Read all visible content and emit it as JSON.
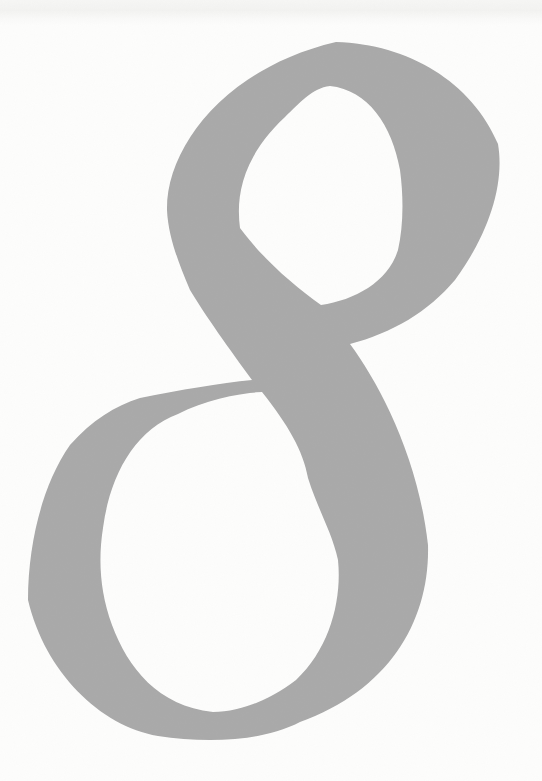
{
  "glyph": {
    "character": "8",
    "description": "large italic serif numeral eight, looped strokes crossing at the waist",
    "color": "#a9a9a9"
  },
  "background": {
    "color": "#fdfdfc",
    "scan_band_color": "#c8c8c3"
  }
}
